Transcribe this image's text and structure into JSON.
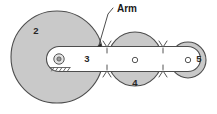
{
  "diagram": {
    "background_color": "#ffffff",
    "gear_fill": "#c9c9c9",
    "arm_fill": "#ffffff",
    "stroke_color": "#4d4d4d",
    "text_color": "#262626",
    "annotations": {
      "arm_label": "Arm"
    },
    "parts": [
      {
        "id": "gear-2",
        "label": "2",
        "kind": "gear",
        "cx": 57,
        "cy": 57,
        "r": 46,
        "label_x": 36,
        "label_y": 31
      },
      {
        "id": "arm-3",
        "label": "3",
        "kind": "arm",
        "label_x": 87,
        "label_y": 59
      },
      {
        "id": "gear-4",
        "label": "4",
        "kind": "gear",
        "cx": 135,
        "cy": 59,
        "r": 27,
        "label_x": 135,
        "label_y": 83
      },
      {
        "id": "gear-5",
        "label": "5",
        "kind": "gear",
        "cx": 188,
        "cy": 60,
        "r": 18,
        "label_x": 199,
        "label_y": 59
      }
    ],
    "pivots": [
      {
        "id": "ground-pivot",
        "cx": 59,
        "cy": 59,
        "r": 5,
        "fixed": true
      },
      {
        "id": "pin-4",
        "cx": 135,
        "cy": 60,
        "r": 2.6,
        "fixed": false
      },
      {
        "id": "pin-5",
        "cx": 188,
        "cy": 60,
        "r": 2.6,
        "fixed": false
      }
    ],
    "mesh_points": [
      {
        "id": "mesh-2-4",
        "x": 107,
        "y": 59
      },
      {
        "id": "mesh-4-5",
        "x": 163,
        "y": 59
      }
    ]
  }
}
